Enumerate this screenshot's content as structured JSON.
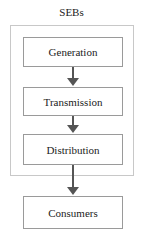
{
  "diagram": {
    "title": "SEBs",
    "nodes": [
      {
        "id": "generation",
        "label": "Generation"
      },
      {
        "id": "transmission",
        "label": "Transmission"
      },
      {
        "id": "distribution",
        "label": "Distribution"
      },
      {
        "id": "consumers",
        "label": "Consumers"
      }
    ],
    "edges": [
      {
        "from": "generation",
        "to": "transmission"
      },
      {
        "from": "transmission",
        "to": "distribution"
      },
      {
        "from": "distribution",
        "to": "consumers"
      }
    ],
    "group": {
      "label": "SEBs",
      "contains": [
        "generation",
        "transmission",
        "distribution"
      ]
    }
  }
}
